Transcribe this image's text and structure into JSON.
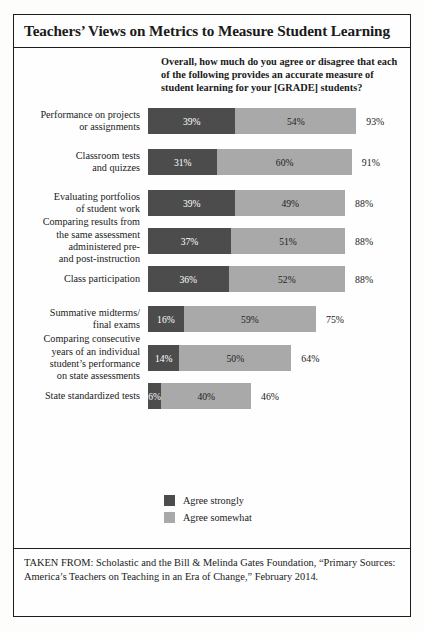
{
  "title": "Teachers’ Views on Metrics to Measure Student Learning",
  "question": "Overall, how much do you agree or disagree that each of the following provides an accurate measure of student learning for your [GRADE] students?",
  "legend": [
    {
      "key": "strong",
      "label": "Agree strongly",
      "color": "#4c4c4c"
    },
    {
      "key": "somewhat",
      "label": "Agree somewhat",
      "color": "#a9a9a9"
    }
  ],
  "source": "TAKEN FROM: Scholastic and the Bill & Melinda Gates Foundation, “Primary Sources: America’s Teachers on Teaching in an Era of Change,” February 2014.",
  "chart_data": {
    "type": "bar",
    "orientation": "horizontal",
    "stacked": true,
    "title": "Teachers’ Views on Metrics to Measure Student Learning",
    "subtitle": "Overall, how much do you agree or disagree that each of the following provides an accurate measure of student learning for your [GRADE] students?",
    "xlabel": "",
    "ylabel": "",
    "xlim": [
      0,
      100
    ],
    "grid": false,
    "legend_position": "bottom-center",
    "units": "percent",
    "categories": [
      "Performance on projects or assignments",
      "Classroom tests and quizzes",
      "Evaluating portfolios of student work",
      "Comparing results from the same assessment administered pre- and post-instruction",
      "Class participation",
      "Summative midterms/ final exams",
      "Comparing consecutive years of an individual student’s performance on state assessments",
      "State standardized tests"
    ],
    "series": [
      {
        "name": "Agree strongly",
        "color": "#4c4c4c",
        "values": [
          39,
          31,
          39,
          37,
          36,
          16,
          14,
          6
        ]
      },
      {
        "name": "Agree somewhat",
        "color": "#a9a9a9",
        "values": [
          54,
          60,
          49,
          51,
          52,
          59,
          50,
          40
        ]
      }
    ],
    "totals": [
      93,
      91,
      88,
      88,
      88,
      75,
      64,
      46
    ],
    "rows": [
      {
        "label_lines": [
          "Performance on projects",
          "or assignments"
        ],
        "strong": 39,
        "strong_text": "39%",
        "somewhat": 54,
        "somewhat_text": "54%",
        "total": 93,
        "total_text": "93%"
      },
      {
        "label_lines": [
          "Classroom tests",
          "and quizzes"
        ],
        "strong": 31,
        "strong_text": "31%",
        "somewhat": 60,
        "somewhat_text": "60%",
        "total": 91,
        "total_text": "91%"
      },
      {
        "label_lines": [
          "Evaluating portfolios",
          "of student work"
        ],
        "strong": 39,
        "strong_text": "39%",
        "somewhat": 49,
        "somewhat_text": "49%",
        "total": 88,
        "total_text": "88%"
      },
      {
        "label_lines": [
          "Comparing results from",
          "the same assessment",
          "administered pre-",
          "and post-instruction"
        ],
        "strong": 37,
        "strong_text": "37%",
        "somewhat": 51,
        "somewhat_text": "51%",
        "total": 88,
        "total_text": "88%"
      },
      {
        "label_lines": [
          "Class participation"
        ],
        "strong": 36,
        "strong_text": "36%",
        "somewhat": 52,
        "somewhat_text": "52%",
        "total": 88,
        "total_text": "88%"
      },
      {
        "label_lines": [
          "Summative midterms/",
          "final exams"
        ],
        "strong": 16,
        "strong_text": "16%",
        "somewhat": 59,
        "somewhat_text": "59%",
        "total": 75,
        "total_text": "75%"
      },
      {
        "label_lines": [
          "Comparing consecutive",
          "years of an individual",
          "student’s performance",
          "on state assessments"
        ],
        "strong": 14,
        "strong_text": "14%",
        "somewhat": 50,
        "somewhat_text": "50%",
        "total": 64,
        "total_text": "64%"
      },
      {
        "label_lines": [
          "State standardized tests"
        ],
        "strong": 6,
        "strong_text": "6%",
        "somewhat": 40,
        "somewhat_text": "40%",
        "total": 46,
        "total_text": "46%"
      }
    ]
  }
}
